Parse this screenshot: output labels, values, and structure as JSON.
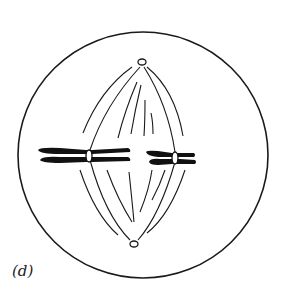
{
  "figure": {
    "label": "(d)",
    "colors": {
      "line": "#1a1a1a",
      "background": "#ffffff"
    }
  }
}
